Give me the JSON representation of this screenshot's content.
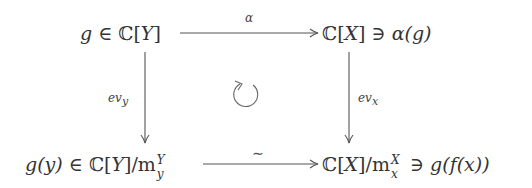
{
  "diagram": {
    "type": "commutative-square",
    "nodes": {
      "top_left": {
        "pre": "g ∈ ",
        "ring": "ℂ",
        "open": "[",
        "var": "Y",
        "close": "]"
      },
      "top_right": {
        "ring": "ℂ",
        "open": "[",
        "var": "X",
        "close": "] ∋ ",
        "elem_fn": "α",
        "elem_arg": "(g)"
      },
      "bottom_left": {
        "pre_g": "g",
        "pre_arg": "(y) ∈ ",
        "ring": "ℂ",
        "open": "[",
        "var": "Y",
        "close": "]/",
        "ideal": "m",
        "ideal_sup": "Y",
        "ideal_sub": "y"
      },
      "bottom_right": {
        "ring": "ℂ",
        "open": "[",
        "var": "X",
        "close": "]/",
        "ideal": "m",
        "ideal_sup": "X",
        "ideal_sub": "x",
        "post": " ∋ ",
        "elem": "g(f(x))"
      }
    },
    "arrows": {
      "top": {
        "label": "α",
        "from": "top_left",
        "to": "top_right"
      },
      "bottom": {
        "label": "∼",
        "from": "bottom_left",
        "to": "bottom_right"
      },
      "left": {
        "label_main": "ev",
        "label_sub": "y",
        "from": "top_left",
        "to": "bottom_left"
      },
      "right": {
        "label_main": "ev",
        "label_sub": "x",
        "from": "top_right",
        "to": "bottom_right"
      }
    },
    "center_symbol": "↻",
    "colors": {
      "text": "#333333",
      "arrow": "#555555",
      "background": "#ffffff"
    }
  }
}
